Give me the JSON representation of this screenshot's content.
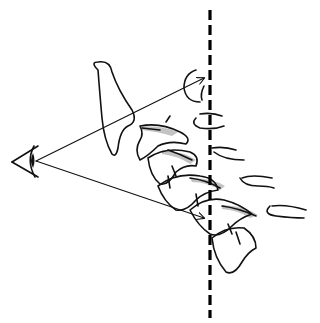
{
  "diagram": {
    "colors": {
      "background": "#ffffff",
      "ink": "#111111",
      "shading": "#b8b8b8",
      "dashed_line": "#000000"
    },
    "elements": [
      {
        "name": "eye",
        "position": [
          28,
          160
        ]
      },
      {
        "name": "upper-sight-arrow",
        "from": [
          36,
          160
        ],
        "to": [
          205,
          78
        ]
      },
      {
        "name": "lower-sight-arrow",
        "from": [
          36,
          160
        ],
        "to": [
          205,
          217
        ]
      },
      {
        "name": "vertical-dashed-line",
        "x": 210,
        "y_start": 10,
        "y_end": 318
      },
      {
        "name": "vertebrae",
        "count": 5
      }
    ]
  }
}
